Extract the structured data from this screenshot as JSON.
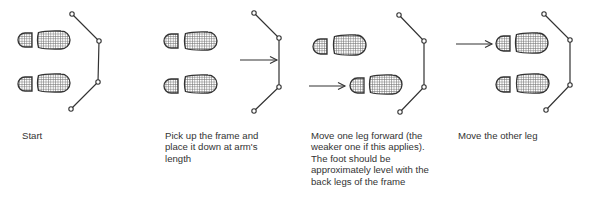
{
  "colors": {
    "ink": "#333333",
    "hatch": "#555555",
    "background": "#ffffff"
  },
  "steps": [
    {
      "id": "start",
      "caption": "Start",
      "caption_pos": [
        22,
        130
      ],
      "caption_width": 70,
      "feet": [
        {
          "heel": [
            18,
            33,
            14,
            14
          ],
          "sole": [
            37,
            31,
            33,
            18
          ]
        },
        {
          "heel": [
            18,
            77,
            14,
            14
          ],
          "sole": [
            37,
            74,
            33,
            18
          ]
        }
      ],
      "arrow": null,
      "frame": [
        [
          72,
          14
        ],
        [
          99,
          41
        ],
        [
          98,
          82
        ],
        [
          71,
          109
        ]
      ]
    },
    {
      "id": "pick-up-frame",
      "caption": "Pick up the frame and place it down at arm's length",
      "caption_pos": [
        165,
        130
      ],
      "caption_width": 108,
      "feet": [
        {
          "heel": [
            164,
            34,
            14,
            14
          ],
          "sole": [
            184,
            32,
            33,
            18
          ]
        },
        {
          "heel": [
            164,
            79,
            14,
            14
          ],
          "sole": [
            184,
            75,
            33,
            18
          ]
        }
      ],
      "arrow": {
        "from": [
          240,
          60
        ],
        "to": [
          277,
          60
        ]
      },
      "frame": [
        [
          254,
          13
        ],
        [
          279,
          38
        ],
        [
          279,
          87
        ],
        [
          254,
          111
        ]
      ]
    },
    {
      "id": "move-one-leg",
      "caption": "Move one leg forward (the weaker one if this applies). The foot should be approximately level with the back legs of the frame",
      "caption_pos": [
        311,
        130
      ],
      "caption_width": 118,
      "feet": [
        {
          "heel": [
            313,
            39,
            14,
            15
          ],
          "sole": [
            333,
            35,
            33,
            20
          ]
        },
        {
          "heel": [
            350,
            78,
            14,
            15
          ],
          "sole": [
            369,
            75,
            33,
            19
          ]
        }
      ],
      "arrow": {
        "from": [
          309,
          86
        ],
        "to": [
          345,
          86
        ]
      },
      "frame": [
        [
          399,
          15
        ],
        [
          424,
          41
        ],
        [
          424,
          87
        ],
        [
          400,
          112
        ]
      ]
    },
    {
      "id": "move-other-leg",
      "caption": "Move the other leg",
      "caption_pos": [
        458,
        130
      ],
      "caption_width": 82,
      "feet": [
        {
          "heel": [
            496,
            36,
            14,
            15
          ],
          "sole": [
            515,
            33,
            33,
            20
          ]
        },
        {
          "heel": [
            496,
            77,
            14,
            15
          ],
          "sole": [
            516,
            74,
            33,
            19
          ]
        }
      ],
      "arrow": {
        "from": [
          456,
          44
        ],
        "to": [
          492,
          44
        ]
      },
      "frame": [
        [
          544,
          14
        ],
        [
          570,
          40
        ],
        [
          570,
          85
        ],
        [
          546,
          110
        ]
      ]
    }
  ]
}
